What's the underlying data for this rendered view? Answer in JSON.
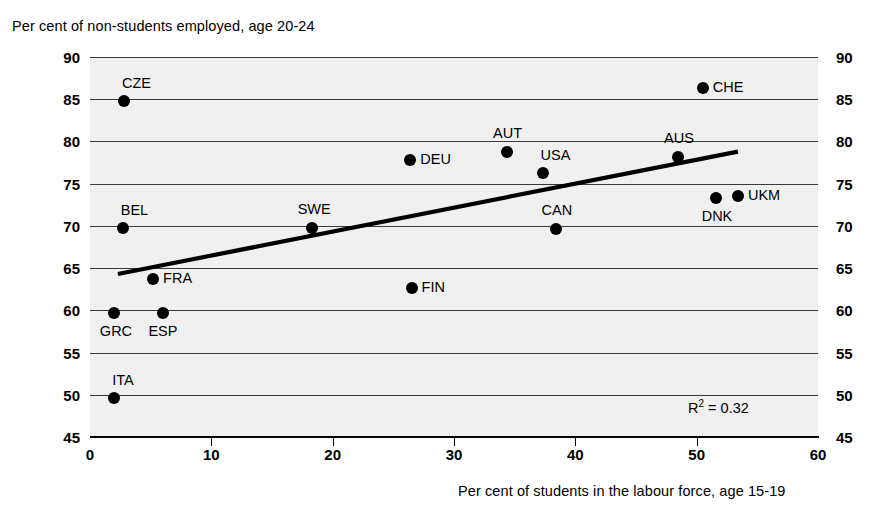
{
  "chart_data": {
    "type": "scatter",
    "title": "",
    "ylabel": "Per cent of non-students employed, age 20-24",
    "xlabel": "Per cent of students in the labour force, age 15-19",
    "xlim": [
      0,
      60
    ],
    "ylim": [
      45,
      90
    ],
    "xticks": [
      0,
      10,
      20,
      30,
      40,
      50,
      60
    ],
    "yticks": [
      45,
      50,
      55,
      60,
      65,
      70,
      75,
      80,
      85,
      90
    ],
    "grid": "horizontal",
    "legend": "none",
    "annotations": [
      {
        "name": "r-squared",
        "text_prefix": "R",
        "text_sup": "2",
        "text_suffix": " = 0.32",
        "value": 0.32
      }
    ],
    "trendline": {
      "type": "linear",
      "x_start": 2.3,
      "y_start": 64.3,
      "x_end": 53.4,
      "y_end": 78.8
    },
    "points": [
      {
        "label": "CZE",
        "x": 2.8,
        "y": 84.8,
        "label_pos": "above-right"
      },
      {
        "label": "CHE",
        "x": 50.5,
        "y": 86.3,
        "label_pos": "right"
      },
      {
        "label": "AUT",
        "x": 34.4,
        "y": 78.8,
        "label_pos": "above"
      },
      {
        "label": "AUS",
        "x": 48.5,
        "y": 78.2,
        "label_pos": "above"
      },
      {
        "label": "DEU",
        "x": 26.4,
        "y": 77.8,
        "label_pos": "right"
      },
      {
        "label": "USA",
        "x": 37.3,
        "y": 76.3,
        "label_pos": "above-right"
      },
      {
        "label": "UKM",
        "x": 53.4,
        "y": 73.5,
        "label_pos": "right"
      },
      {
        "label": "DNK",
        "x": 51.6,
        "y": 73.3,
        "label_pos": "below"
      },
      {
        "label": "SWE",
        "x": 18.3,
        "y": 69.8,
        "label_pos": "above"
      },
      {
        "label": "BEL",
        "x": 2.7,
        "y": 69.8,
        "label_pos": "above-right"
      },
      {
        "label": "CAN",
        "x": 38.4,
        "y": 69.6,
        "label_pos": "above"
      },
      {
        "label": "FRA",
        "x": 5.2,
        "y": 63.7,
        "label_pos": "right"
      },
      {
        "label": "FIN",
        "x": 26.5,
        "y": 62.6,
        "label_pos": "right"
      },
      {
        "label": "GRC",
        "x": 2.0,
        "y": 59.7,
        "label_pos": "below"
      },
      {
        "label": "ESP",
        "x": 6.0,
        "y": 59.7,
        "label_pos": "below"
      },
      {
        "label": "ITA",
        "x": 2.0,
        "y": 49.6,
        "label_pos": "above-right"
      }
    ]
  },
  "colors": {
    "plot_background": "#f0f0f0",
    "gridline": "#3a3a3a",
    "axis": "#000000",
    "marker": "#000000",
    "trendline": "#000000",
    "text": "#000000"
  }
}
